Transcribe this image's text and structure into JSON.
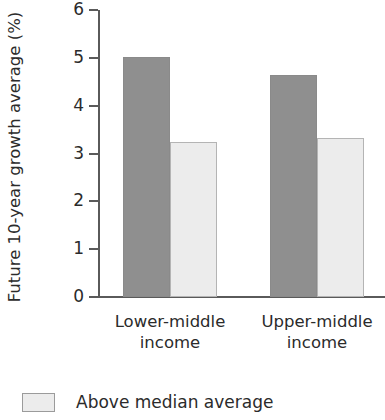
{
  "chart_data": {
    "type": "bar",
    "title": "",
    "subtitle": "",
    "xlabel": "",
    "ylabel": "Future 10-year growth average (%)",
    "categories": [
      "Lower-middle\nincome",
      "Upper-middle\nincome"
    ],
    "category_lines": [
      [
        "Lower-middle",
        "income"
      ],
      [
        "Upper-middle",
        "income"
      ]
    ],
    "series": [
      {
        "name": "Below median average",
        "values": [
          5.02,
          4.65
        ],
        "color": "#8f8f8f"
      },
      {
        "name": "Above median average",
        "values": [
          3.25,
          3.32
        ],
        "color": "#ececec"
      }
    ],
    "ylim": [
      0,
      6
    ],
    "yticks": [
      0,
      1,
      2,
      3,
      4,
      5,
      6
    ],
    "ytick_labels": [
      "0",
      "1",
      "2",
      "3",
      "4",
      "5",
      "6"
    ],
    "grid": false,
    "legend_position": "bottom-left",
    "legend_entries": [
      {
        "label": "Above median average",
        "color": "#ececec",
        "border": "#9b9b9b"
      }
    ],
    "axis_color": "#5a5a5a"
  }
}
